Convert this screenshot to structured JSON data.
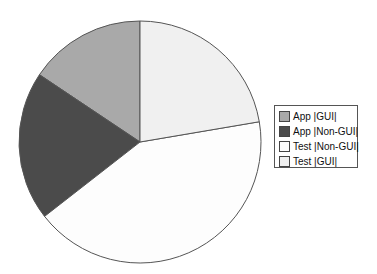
{
  "chart_data": {
    "type": "pie",
    "title": "",
    "categories": [
      "App |GUI|",
      "App |Non-GUI|",
      "Test |Non-GUI|",
      "Test |GUI|"
    ],
    "values": [
      15.6,
      19.9,
      42.1,
      22.3
    ],
    "colors": [
      "#a9a9a9",
      "#4b4b4b",
      "#fdfdfd",
      "#f0f0f0"
    ],
    "start_angle_deg": 90,
    "direction": "counterclockwise",
    "legend_position": "right"
  },
  "legend": {
    "items": [
      {
        "label": "App |GUI|",
        "color": "#a9a9a9"
      },
      {
        "label": "App |Non-GUI|",
        "color": "#4b4b4b"
      },
      {
        "label": "Test |Non-GUI|",
        "color": "#fdfdfd"
      },
      {
        "label": "Test |GUI|",
        "color": "#f0f0f0"
      }
    ]
  }
}
